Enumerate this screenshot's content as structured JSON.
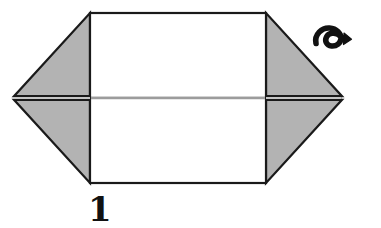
{
  "figure": {
    "step_number": "1",
    "symbols": {
      "turn_over_arrow": "turn-over-arrow-icon",
      "turn_over_label": "turn over"
    },
    "colors": {
      "paper_front": "#ffffff",
      "paper_back_shaded": "#b3b3b3",
      "outline": "#1a1a1a",
      "fold_line": "#c8c8c8",
      "background": "#ffffff",
      "ink": "#111111"
    },
    "parts": [
      {
        "name": "center-panel-upper",
        "fill": "#ffffff",
        "description": "Upper half of central white rectangle"
      },
      {
        "name": "center-panel-lower",
        "fill": "#ffffff",
        "description": "Lower half of central white rectangle"
      },
      {
        "name": "left-wing-upper",
        "fill": "#b3b3b3",
        "description": "Upper-left shaded triangular flap"
      },
      {
        "name": "left-wing-lower",
        "fill": "#b3b3b3",
        "description": "Lower-left shaded triangular flap"
      },
      {
        "name": "right-wing-upper",
        "fill": "#b3b3b3",
        "description": "Upper-right shaded triangular flap"
      },
      {
        "name": "right-wing-lower",
        "fill": "#b3b3b3",
        "description": "Lower-right shaded triangular flap"
      },
      {
        "name": "horizontal-fold-line",
        "fill": "#c8c8c8",
        "description": "Faint horizontal crease across center panel"
      }
    ],
    "geometry": {
      "rect_left": 90,
      "rect_right": 266,
      "rect_top": 13,
      "rect_bottom": 183,
      "left_vertex_x": 13,
      "right_vertex_x": 341,
      "mid_y": 98
    }
  }
}
